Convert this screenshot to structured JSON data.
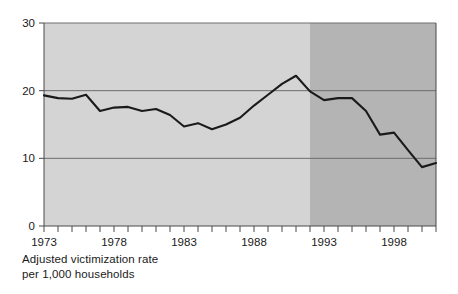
{
  "caption": {
    "line1": "Adjusted victimization rate",
    "line2": "per 1,000 households"
  },
  "colors": {
    "band_early": "#d4d4d4",
    "band_late": "#b4b4b4",
    "line": "#1a1a1a",
    "gridline": "#6e6e6e",
    "axis": "#4a4a4a",
    "text": "#1a1a1a"
  },
  "chart_data": {
    "type": "line",
    "title": "",
    "subtitle": "",
    "xlabel": "",
    "ylabel": "Adjusted victimization rate per 1,000 households",
    "xlim": [
      1973,
      2001
    ],
    "ylim": [
      0,
      30
    ],
    "ytick_values": [
      0,
      10,
      20,
      30
    ],
    "ytick_labels": [
      "0",
      "10",
      "20",
      "30"
    ],
    "xtick_values": [
      1973,
      1974,
      1975,
      1976,
      1977,
      1978,
      1979,
      1980,
      1981,
      1982,
      1983,
      1984,
      1985,
      1986,
      1987,
      1988,
      1989,
      1990,
      1991,
      1992,
      1993,
      1994,
      1995,
      1996,
      1997,
      1998,
      1999,
      2000,
      2001
    ],
    "xtick_labels_shown": [
      "1973",
      "1978",
      "1983",
      "1988",
      "1993",
      "1998"
    ],
    "xtick_labeled_values": [
      1973,
      1978,
      1983,
      1988,
      1993,
      1998
    ],
    "grid": true,
    "grid_axis": "y",
    "legend": false,
    "legend_position": "none",
    "series": [
      {
        "name": "Adjusted victimization rate per 1,000 households",
        "x": [
          1973,
          1974,
          1975,
          1976,
          1977,
          1978,
          1979,
          1980,
          1981,
          1982,
          1983,
          1984,
          1985,
          1986,
          1987,
          1988,
          1989,
          1990,
          1991,
          1992,
          1993,
          1994,
          1995,
          1996,
          1997,
          1998,
          1999,
          2000,
          2001
        ],
        "values": [
          19.3,
          18.9,
          18.8,
          19.4,
          17.0,
          17.5,
          17.6,
          17.0,
          17.3,
          16.4,
          14.7,
          15.2,
          14.3,
          15.0,
          16.0,
          17.8,
          19.4,
          21.0,
          22.2,
          19.9,
          18.6,
          18.9,
          18.9,
          17.0,
          13.5,
          13.8,
          11.2,
          8.7,
          9.3
        ]
      }
    ],
    "bands": [
      {
        "name": "early-period-band",
        "x_start": 1973,
        "x_end": 1992,
        "color": "#d4d4d4"
      },
      {
        "name": "late-period-band",
        "x_start": 1992,
        "x_end": 2001,
        "color": "#b4b4b4"
      }
    ],
    "annotations": []
  }
}
